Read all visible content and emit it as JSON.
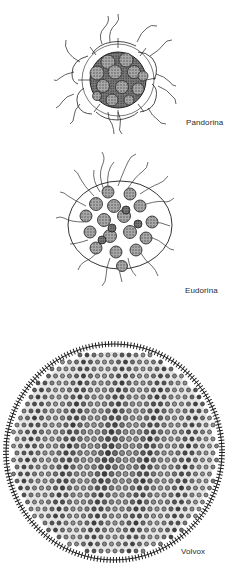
{
  "figure": {
    "organisms": [
      {
        "name": "Pandorina",
        "label_x": 186,
        "label_y": 118
      },
      {
        "name": "Eudorina",
        "label_x": 185,
        "label_y": 286
      },
      {
        "name": "Volvox",
        "label_x": 181,
        "label_y": 547
      }
    ]
  },
  "colors": {
    "ink": "#1e1e1e",
    "cell_fill": "#9a9a9a",
    "cell_dark": "#3a3a3a",
    "background": "#ffffff"
  }
}
